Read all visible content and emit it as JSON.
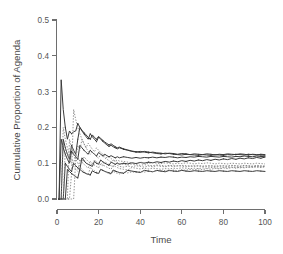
{
  "chart_data": {
    "type": "line",
    "title": "",
    "xlabel": "Time",
    "ylabel": "Cumulative Proportion of Agenda",
    "xlim": [
      0,
      100
    ],
    "ylim": [
      0.0,
      0.5
    ],
    "xticks": [
      "0",
      "20",
      "40",
      "60",
      "80",
      "100"
    ],
    "xtick_values": [
      0,
      20,
      40,
      60,
      80,
      100
    ],
    "yticks": [
      "0.0",
      "0.1",
      "0.2",
      "0.3",
      "0.4",
      "0.5"
    ],
    "ytick_values": [
      0.0,
      0.1,
      0.2,
      0.3,
      0.4,
      0.5
    ],
    "grid": false,
    "legend": null,
    "legend_position": "none",
    "background_color": "#ffffff",
    "axis_color": "#6e6e6e",
    "solid_line_color": "#3a3a3a",
    "dotted_line_color": "#7d7d7d",
    "x": [
      1,
      2,
      3,
      4,
      5,
      6,
      7,
      8,
      9,
      10,
      11,
      12,
      13,
      14,
      15,
      16,
      17,
      18,
      19,
      20,
      21,
      22,
      23,
      24,
      25,
      26,
      27,
      28,
      29,
      30,
      32,
      34,
      36,
      38,
      40,
      42,
      44,
      46,
      48,
      50,
      52,
      54,
      56,
      58,
      60,
      62,
      64,
      66,
      68,
      70,
      72,
      74,
      76,
      78,
      80,
      82,
      84,
      86,
      88,
      90,
      92,
      94,
      96,
      98,
      100
    ],
    "series": [
      {
        "name": "series-1",
        "style": "solid",
        "values": [
          0.0,
          0.333,
          0.25,
          0.2,
          0.167,
          0.19,
          0.182,
          0.188,
          0.19,
          0.211,
          0.2,
          0.192,
          0.185,
          0.179,
          0.172,
          0.167,
          0.179,
          0.172,
          0.167,
          0.175,
          0.169,
          0.164,
          0.159,
          0.155,
          0.151,
          0.154,
          0.15,
          0.146,
          0.143,
          0.145,
          0.14,
          0.137,
          0.134,
          0.132,
          0.13,
          0.133,
          0.131,
          0.129,
          0.127,
          0.126,
          0.128,
          0.127,
          0.125,
          0.124,
          0.123,
          0.125,
          0.124,
          0.123,
          0.122,
          0.124,
          0.123,
          0.122,
          0.124,
          0.123,
          0.122,
          0.124,
          0.123,
          0.125,
          0.124,
          0.123,
          0.125,
          0.124,
          0.123,
          0.125,
          0.124
        ]
      },
      {
        "name": "series-2",
        "style": "solid",
        "values": [
          0.0,
          0.0,
          0.167,
          0.143,
          0.125,
          0.111,
          0.15,
          0.136,
          0.125,
          0.167,
          0.2,
          0.19,
          0.182,
          0.174,
          0.167,
          0.182,
          0.174,
          0.167,
          0.16,
          0.173,
          0.167,
          0.161,
          0.156,
          0.151,
          0.147,
          0.15,
          0.146,
          0.143,
          0.14,
          0.143,
          0.139,
          0.136,
          0.133,
          0.131,
          0.133,
          0.131,
          0.129,
          0.131,
          0.129,
          0.128,
          0.126,
          0.128,
          0.127,
          0.125,
          0.127,
          0.126,
          0.124,
          0.126,
          0.125,
          0.124,
          0.126,
          0.125,
          0.123,
          0.125,
          0.124,
          0.126,
          0.125,
          0.124,
          0.126,
          0.125,
          0.123,
          0.125,
          0.124,
          0.123,
          0.122
        ]
      },
      {
        "name": "series-3",
        "style": "solid",
        "values": [
          0.0,
          0.167,
          0.143,
          0.125,
          0.111,
          0.1,
          0.133,
          0.125,
          0.118,
          0.111,
          0.15,
          0.143,
          0.136,
          0.13,
          0.125,
          0.136,
          0.13,
          0.125,
          0.12,
          0.13,
          0.125,
          0.121,
          0.125,
          0.121,
          0.118,
          0.121,
          0.118,
          0.115,
          0.118,
          0.115,
          0.118,
          0.116,
          0.114,
          0.116,
          0.114,
          0.116,
          0.115,
          0.117,
          0.115,
          0.117,
          0.116,
          0.118,
          0.117,
          0.115,
          0.117,
          0.116,
          0.118,
          0.117,
          0.119,
          0.118,
          0.117,
          0.119,
          0.118,
          0.117,
          0.119,
          0.118,
          0.117,
          0.119,
          0.118,
          0.12,
          0.119,
          0.118,
          0.12,
          0.119,
          0.118
        ]
      },
      {
        "name": "series-4",
        "style": "solid",
        "values": [
          0.0,
          0.0,
          0.0,
          0.1,
          0.091,
          0.083,
          0.077,
          0.1,
          0.093,
          0.087,
          0.083,
          0.115,
          0.107,
          0.1,
          0.097,
          0.094,
          0.091,
          0.105,
          0.1,
          0.097,
          0.109,
          0.104,
          0.1,
          0.097,
          0.094,
          0.103,
          0.1,
          0.097,
          0.1,
          0.097,
          0.1,
          0.098,
          0.101,
          0.099,
          0.102,
          0.1,
          0.103,
          0.101,
          0.104,
          0.102,
          0.105,
          0.103,
          0.106,
          0.104,
          0.107,
          0.105,
          0.108,
          0.106,
          0.109,
          0.107,
          0.11,
          0.108,
          0.111,
          0.109,
          0.112,
          0.11,
          0.113,
          0.111,
          0.114,
          0.112,
          0.115,
          0.113,
          0.116,
          0.114,
          0.117
        ]
      },
      {
        "name": "series-5",
        "style": "solid",
        "values": [
          0.0,
          0.0,
          0.0,
          0.0,
          0.083,
          0.077,
          0.071,
          0.067,
          0.062,
          0.059,
          0.083,
          0.077,
          0.074,
          0.071,
          0.069,
          0.067,
          0.079,
          0.075,
          0.073,
          0.071,
          0.083,
          0.08,
          0.077,
          0.075,
          0.073,
          0.071,
          0.081,
          0.078,
          0.076,
          0.074,
          0.072,
          0.08,
          0.078,
          0.076,
          0.074,
          0.08,
          0.078,
          0.076,
          0.08,
          0.078,
          0.076,
          0.08,
          0.078,
          0.077,
          0.08,
          0.078,
          0.077,
          0.079,
          0.078,
          0.077,
          0.079,
          0.078,
          0.077,
          0.079,
          0.078,
          0.077,
          0.079,
          0.078,
          0.077,
          0.079,
          0.078,
          0.077,
          0.079,
          0.078,
          0.077
        ]
      },
      {
        "name": "series-6",
        "style": "dotted",
        "values": [
          0.0,
          0.0,
          0.0,
          0.0,
          0.0,
          0.0,
          0.071,
          0.25,
          0.222,
          0.2,
          0.182,
          0.167,
          0.154,
          0.143,
          0.156,
          0.147,
          0.139,
          0.132,
          0.143,
          0.136,
          0.13,
          0.125,
          0.12,
          0.115,
          0.118,
          0.113,
          0.109,
          0.106,
          0.109,
          0.106,
          0.105,
          0.103,
          0.101,
          0.099,
          0.103,
          0.101,
          0.099,
          0.102,
          0.1,
          0.099,
          0.101,
          0.1,
          0.098,
          0.1,
          0.099,
          0.101,
          0.1,
          0.098,
          0.1,
          0.099,
          0.101,
          0.1,
          0.098,
          0.1,
          0.099,
          0.098,
          0.1,
          0.099,
          0.098,
          0.1,
          0.099,
          0.098,
          0.1,
          0.099,
          0.098
        ]
      },
      {
        "name": "series-7",
        "style": "dotted",
        "values": [
          0.0,
          0.0,
          0.0,
          0.0,
          0.0,
          0.167,
          0.143,
          0.125,
          0.111,
          0.15,
          0.136,
          0.167,
          0.154,
          0.143,
          0.133,
          0.125,
          0.132,
          0.125,
          0.119,
          0.114,
          0.125,
          0.12,
          0.115,
          0.111,
          0.107,
          0.103,
          0.109,
          0.105,
          0.102,
          0.099,
          0.097,
          0.095,
          0.098,
          0.096,
          0.094,
          0.096,
          0.094,
          0.093,
          0.095,
          0.094,
          0.092,
          0.094,
          0.093,
          0.092,
          0.094,
          0.093,
          0.092,
          0.093,
          0.092,
          0.091,
          0.093,
          0.092,
          0.091,
          0.093,
          0.092,
          0.091,
          0.093,
          0.092,
          0.091,
          0.093,
          0.092,
          0.091,
          0.092,
          0.091,
          0.09
        ]
      },
      {
        "name": "series-8",
        "style": "dotted",
        "values": [
          0.0,
          0.0,
          0.0,
          0.143,
          0.125,
          0.111,
          0.1,
          0.091,
          0.083,
          0.077,
          0.111,
          0.103,
          0.097,
          0.091,
          0.086,
          0.105,
          0.1,
          0.095,
          0.091,
          0.087,
          0.1,
          0.096,
          0.092,
          0.089,
          0.086,
          0.083,
          0.094,
          0.091,
          0.088,
          0.085,
          0.083,
          0.081,
          0.088,
          0.086,
          0.084,
          0.086,
          0.084,
          0.086,
          0.085,
          0.083,
          0.085,
          0.084,
          0.086,
          0.085,
          0.087,
          0.086,
          0.085,
          0.086,
          0.085,
          0.087,
          0.086,
          0.088,
          0.087,
          0.086,
          0.088,
          0.087,
          0.089,
          0.088,
          0.087,
          0.089,
          0.088,
          0.09,
          0.089,
          0.088,
          0.09
        ]
      },
      {
        "name": "series-9",
        "style": "dotted",
        "values": [
          0.0,
          0.0,
          0.2,
          0.167,
          0.143,
          0.125,
          0.111,
          0.1,
          0.125,
          0.115,
          0.107,
          0.1,
          0.118,
          0.111,
          0.105,
          0.1,
          0.095,
          0.109,
          0.104,
          0.1,
          0.096,
          0.092,
          0.104,
          0.1,
          0.096,
          0.093,
          0.09,
          0.097,
          0.094,
          0.091,
          0.089,
          0.092,
          0.09,
          0.093,
          0.091,
          0.089,
          0.092,
          0.09,
          0.093,
          0.091,
          0.09,
          0.092,
          0.091,
          0.093,
          0.092,
          0.09,
          0.092,
          0.091,
          0.093,
          0.092,
          0.091,
          0.093,
          0.092,
          0.091,
          0.093,
          0.092,
          0.094,
          0.093,
          0.092,
          0.094,
          0.093,
          0.092,
          0.094,
          0.093,
          0.092
        ]
      },
      {
        "name": "series-10",
        "style": "dotted",
        "values": [
          0.0,
          0.0,
          0.0,
          0.0,
          0.0,
          0.0,
          0.0,
          0.0,
          0.111,
          0.1,
          0.091,
          0.083,
          0.077,
          0.071,
          0.067,
          0.088,
          0.083,
          0.079,
          0.075,
          0.071,
          0.083,
          0.08,
          0.077,
          0.074,
          0.071,
          0.069,
          0.077,
          0.074,
          0.072,
          0.07,
          0.075,
          0.073,
          0.076,
          0.074,
          0.077,
          0.075,
          0.078,
          0.076,
          0.079,
          0.077,
          0.08,
          0.078,
          0.081,
          0.079,
          0.082,
          0.08,
          0.083,
          0.081,
          0.084,
          0.082,
          0.085,
          0.083,
          0.086,
          0.084,
          0.087,
          0.085,
          0.088,
          0.086,
          0.089,
          0.087,
          0.09,
          0.088,
          0.091,
          0.089,
          0.092
        ]
      }
    ],
    "annotations": [
      {
        "text": "peak",
        "x": 2,
        "y": 0.333
      },
      {
        "text": "secondary peak",
        "x": 11,
        "y": 0.21
      }
    ]
  },
  "figure": {
    "ylabel": "Cumulative Proportion of Agenda",
    "xlabel": "Time"
  }
}
